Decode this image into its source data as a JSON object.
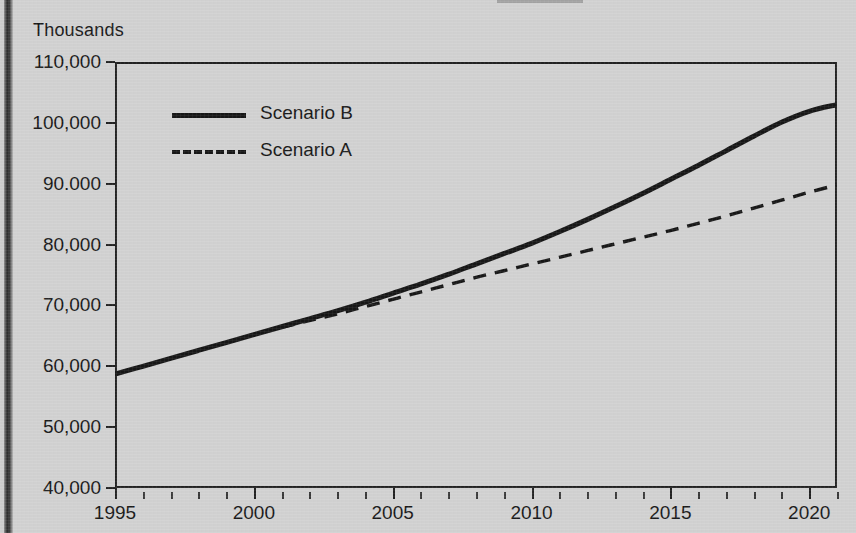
{
  "unit_label": "Thousands",
  "legend": {
    "items": [
      {
        "label": "Scenario B",
        "style": "solid"
      },
      {
        "label": "Scenario A",
        "style": "dashed"
      }
    ]
  },
  "axes": {
    "y_tick_labels": [
      "110,000",
      "100,000",
      "90.000",
      "80,000",
      "70,000",
      "60,000",
      "50,000",
      "40,000"
    ],
    "x_tick_labels": [
      "1995",
      "2000",
      "2005",
      "2010",
      "2015",
      "2020"
    ]
  },
  "chart_data": {
    "type": "line",
    "title": "",
    "subtitle": "",
    "xlabel": "",
    "ylabel": "Thousands",
    "xlim": [
      1995,
      2021
    ],
    "ylim": [
      40000,
      110000
    ],
    "ytick_values": [
      110000,
      100000,
      90000,
      80000,
      70000,
      60000,
      50000,
      40000
    ],
    "xtick_values": [
      1995,
      2000,
      2005,
      2010,
      2015,
      2020
    ],
    "x_minor_tick_step": 1,
    "grid": false,
    "legend_position": "upper-left-inside",
    "series": [
      {
        "name": "Scenario B",
        "style": "solid",
        "color": "#171717",
        "x": [
          1995,
          1996,
          1997,
          1998,
          1999,
          2000,
          2001,
          2002,
          2003,
          2004,
          2005,
          2006,
          2007,
          2008,
          2009,
          2010,
          2011,
          2012,
          2013,
          2014,
          2015,
          2016,
          2017,
          2018,
          2019,
          2020,
          2021
        ],
        "values": [
          58700,
          60000,
          61300,
          62600,
          63900,
          65200,
          66500,
          67800,
          69100,
          70500,
          72000,
          73500,
          75100,
          76800,
          78500,
          80200,
          82100,
          84100,
          86200,
          88400,
          90700,
          93000,
          95400,
          97800,
          100100,
          101900,
          103000
        ]
      },
      {
        "name": "Scenario A",
        "style": "dashed",
        "color": "#171717",
        "x": [
          2001,
          2002,
          2003,
          2004,
          2005,
          2006,
          2007,
          2008,
          2009,
          2010,
          2011,
          2012,
          2013,
          2014,
          2015,
          2016,
          2017,
          2018,
          2019,
          2020,
          2021
        ],
        "values": [
          66400,
          67500,
          68600,
          69800,
          71000,
          72200,
          73400,
          74600,
          75700,
          76800,
          77900,
          79000,
          80100,
          81200,
          82300,
          83500,
          84700,
          86000,
          87300,
          88600,
          89800
        ]
      }
    ],
    "annotations": []
  }
}
